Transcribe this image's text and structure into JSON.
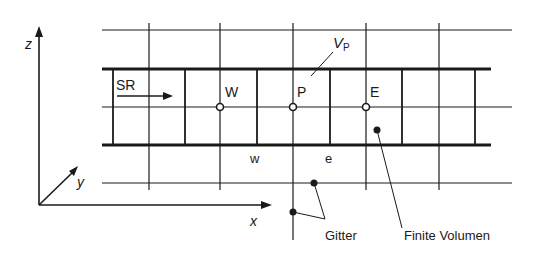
{
  "diagram": {
    "type": "finite-volume-grid",
    "colors": {
      "ink": "#1a1a1a",
      "background": "#ffffff"
    },
    "axes": {
      "z_label": "z",
      "y_label": "y",
      "x_label": "x"
    },
    "labels": {
      "flow_direction": "SR",
      "volume": "V",
      "volume_subscript": "P",
      "node_west": "W",
      "node_center": "P",
      "node_east": "E",
      "face_west": "w",
      "face_east": "e",
      "grid_callout": "Gitter",
      "finite_volume_callout": "Finite Volumen"
    },
    "nodes": [
      {
        "name": "W",
        "type": "open-circle"
      },
      {
        "name": "P",
        "type": "open-circle"
      },
      {
        "name": "E",
        "type": "open-circle"
      }
    ]
  }
}
